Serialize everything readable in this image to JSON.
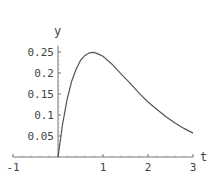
{
  "chart_data": {
    "type": "line",
    "title": "",
    "xlabel": "t",
    "ylabel": "y",
    "xlim": [
      -1,
      3.2
    ],
    "ylim": [
      0,
      0.27
    ],
    "x_ticks": [
      -1,
      1,
      2,
      3
    ],
    "x_tick_labels": [
      "-1",
      "1",
      "2",
      "3"
    ],
    "y_ticks": [
      0.05,
      0.1,
      0.15,
      0.2,
      0.25
    ],
    "y_tick_labels": [
      "0.05",
      "0.1",
      "0.15",
      "0.2",
      "0.25"
    ],
    "grid": false,
    "legend": null,
    "series": [
      {
        "name": "y(t)",
        "x": [
          0,
          0.1,
          0.2,
          0.3,
          0.4,
          0.5,
          0.6,
          0.7,
          0.8,
          0.9,
          1.0,
          1.2,
          1.4,
          1.6,
          1.8,
          2.0,
          2.2,
          2.4,
          2.6,
          2.8,
          3.0
        ],
        "values": [
          0,
          0.077,
          0.136,
          0.179,
          0.208,
          0.23,
          0.242,
          0.248,
          0.249,
          0.245,
          0.24,
          0.221,
          0.198,
          0.176,
          0.152,
          0.131,
          0.113,
          0.096,
          0.081,
          0.068,
          0.057
        ]
      }
    ]
  }
}
